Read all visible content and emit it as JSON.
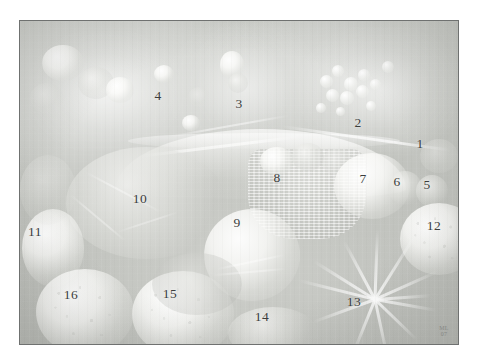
{
  "plate": {
    "title": "Still life key diagram",
    "caption": "",
    "background_color": "#ffffff"
  },
  "painting": {
    "description": "Faded monochrome reproduction of a fruit and vegetable still life, overlaid with numbered identification keys",
    "frame_border_color": "#6f7170",
    "base_color": "#c4c6c1",
    "highlight_color": "#ffffff",
    "signature": {
      "line1": "ML",
      "line2": "07"
    }
  },
  "callouts": [
    {
      "id": 1,
      "label": "1",
      "x": 419,
      "y": 143,
      "target": "fruit-right-edge"
    },
    {
      "id": 2,
      "label": "2",
      "x": 357,
      "y": 122,
      "target": "grape-cluster"
    },
    {
      "id": 3,
      "label": "3",
      "x": 238,
      "y": 103,
      "target": "arched-branch"
    },
    {
      "id": 4,
      "label": "4",
      "x": 157,
      "y": 95,
      "target": "upper-left-foliage"
    },
    {
      "id": 5,
      "label": "5",
      "x": 426,
      "y": 184,
      "target": "small-round-fruit-right"
    },
    {
      "id": 6,
      "label": "6",
      "x": 396,
      "y": 181,
      "target": "small-round-fruit-centre"
    },
    {
      "id": 7,
      "label": "7",
      "x": 362,
      "y": 178,
      "target": "large-pale-gourd"
    },
    {
      "id": 8,
      "label": "8",
      "x": 276,
      "y": 177,
      "target": "woven-basket"
    },
    {
      "id": 9,
      "label": "9",
      "x": 236,
      "y": 222,
      "target": "round-cabbage"
    },
    {
      "id": 10,
      "label": "10",
      "x": 139,
      "y": 198,
      "target": "left-centre-mass"
    },
    {
      "id": 11,
      "label": "11",
      "x": 34,
      "y": 231,
      "target": "left-edge-fruit"
    },
    {
      "id": 12,
      "label": "12",
      "x": 433,
      "y": 225,
      "target": "right-edge-melon"
    },
    {
      "id": 13,
      "label": "13",
      "x": 353,
      "y": 301,
      "target": "leaf-spray"
    },
    {
      "id": 14,
      "label": "14",
      "x": 261,
      "y": 316,
      "target": "foreground-shell"
    },
    {
      "id": 15,
      "label": "15",
      "x": 169,
      "y": 293,
      "target": "speckled-melon-centre"
    },
    {
      "id": 16,
      "label": "16",
      "x": 70,
      "y": 294,
      "target": "speckled-melon-left"
    }
  ]
}
